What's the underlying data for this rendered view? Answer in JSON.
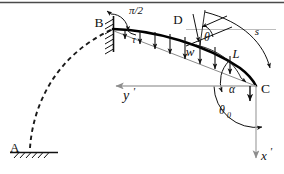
{
  "figure": {
    "type": "engineering-beam-diagram",
    "background_color": "#ffffff",
    "line_color": "#111111",
    "axis_color": "#9a9a9a",
    "beam_color": "#000000",
    "width": 284,
    "height": 174
  },
  "labels": {
    "point_a": "A",
    "point_b": "B",
    "point_c": "C",
    "point_d": "D",
    "angle_pi_over_two": "π/2",
    "angle_tau": "τ",
    "angle_theta": "θ",
    "angle_alpha": "α",
    "angle_theta_zero": "θ",
    "angle_theta_zero_sub": "0",
    "load_w": "w",
    "length_l": "L",
    "arc_s": "s",
    "axis_y_prime": "y",
    "axis_y_prime_tick": "'",
    "axis_x_prime": "x",
    "axis_x_prime_tick": "'"
  },
  "annotations": {
    "support_b": "fixed-wall-hatched-support",
    "support_a": "ground-hatched-support",
    "deformed_shape": "dashed-arc-A-to-B",
    "loaded_beam": "thick-curve-B-to-C",
    "distributed_load": "downward-arrows-along-beam",
    "load_arrow_count": 8
  },
  "geometry": {
    "beam_start": [
      113,
      29
    ],
    "beam_end": [
      256,
      86
    ],
    "point_a": [
      30,
      149
    ],
    "point_d": [
      196,
      42
    ],
    "y_axis_y": 86,
    "y_axis_left_x": 114,
    "y_axis_right_x": 256,
    "x_axis_bottom_y": 160
  }
}
